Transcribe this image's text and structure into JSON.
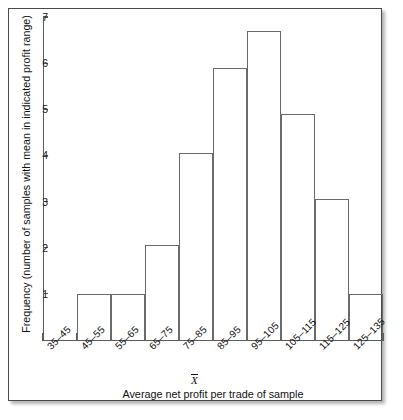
{
  "figure": {
    "frame_border_color": "#4a4a4a",
    "axis_color": "#5a5a5a",
    "bar_outline_color": "#6a6a6a",
    "background_color": "#ffffff"
  },
  "chart_data": {
    "type": "bar",
    "title": "",
    "subtitle": "",
    "xlabel": "Average net profit per trade of sample",
    "ylabel": "Frequency (number of samples with mean in indicated profit range)",
    "categories": [
      "35–45",
      "45–55",
      "55–65",
      "65–75",
      "75–85",
      "85–95",
      "95–105",
      "105–115",
      "115–125",
      "125–135"
    ],
    "values": [
      0,
      1,
      1,
      2.05,
      4.05,
      5.9,
      6.7,
      4.9,
      3.05,
      1
    ],
    "ylim": [
      0,
      7
    ],
    "xlim_bins": 10,
    "ytick_labels": [
      "1",
      "2",
      "3",
      "4",
      "5",
      "6",
      "7"
    ],
    "ytick_values": [
      1,
      2,
      3,
      4,
      5,
      6,
      7
    ],
    "grid": false,
    "legend": false,
    "legend_position": "none",
    "annotations": [
      {
        "label": "X̄",
        "text": "X-bar",
        "at_category": "85–95",
        "description": "mean marker below the 85–95 bin label"
      }
    ]
  }
}
